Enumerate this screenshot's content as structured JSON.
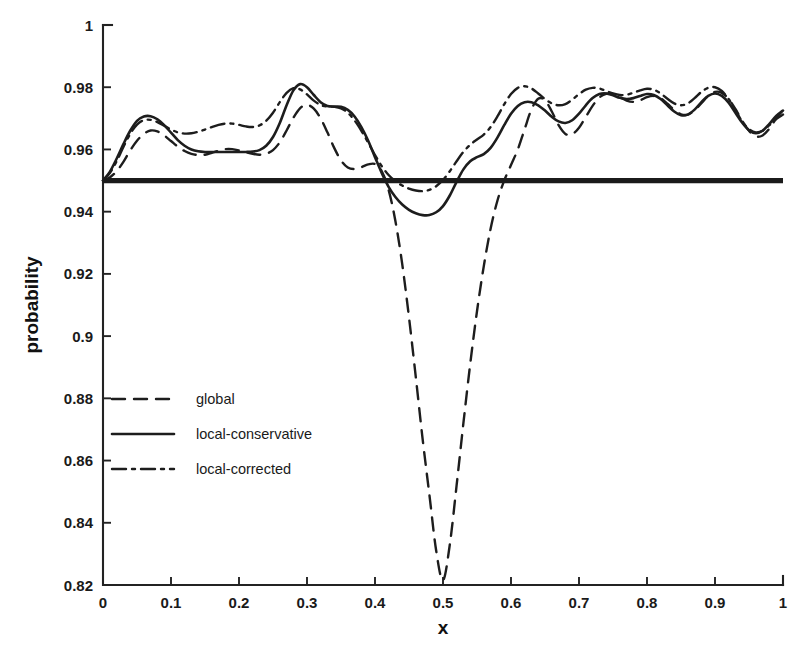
{
  "chart_data": {
    "type": "line",
    "title": "",
    "xlabel": "x",
    "ylabel": "probability",
    "xlim": [
      0,
      1
    ],
    "ylim": [
      0.82,
      1
    ],
    "grid": false,
    "legend_position": "center-left",
    "xticks": [
      0,
      0.1,
      0.2,
      0.3,
      0.4,
      0.5,
      0.6,
      0.7,
      0.8,
      0.9,
      1
    ],
    "xticklabels": [
      "0",
      "0.1",
      "0.2",
      "0.3",
      "0.4",
      "0.5",
      "0.6",
      "0.7",
      "0.8",
      "0.9",
      "1"
    ],
    "yticks": [
      0.82,
      0.84,
      0.86,
      0.88,
      0.9,
      0.92,
      0.94,
      0.96,
      0.98,
      1
    ],
    "yticklabels": [
      "0.82",
      "0.84",
      "0.86",
      "0.88",
      "0.9",
      "0.92",
      "0.94",
      "0.96",
      "0.98",
      "1"
    ],
    "reference_line": {
      "orientation": "horizontal",
      "y": 0.95,
      "label": "",
      "linestyle": "solid",
      "linewidth": 5.2,
      "color": "#1b1b1b"
    },
    "series": [
      {
        "name": "global",
        "linestyle": "dashed",
        "dasharray": "13 9",
        "linewidth": 2.4,
        "color": "#1d1d1d",
        "x": [
          0.0,
          0.01,
          0.02,
          0.03,
          0.04,
          0.05,
          0.06,
          0.07,
          0.08,
          0.09,
          0.1,
          0.11,
          0.12,
          0.13,
          0.14,
          0.15,
          0.16,
          0.17,
          0.18,
          0.19,
          0.2,
          0.21,
          0.22,
          0.23,
          0.24,
          0.25,
          0.26,
          0.27,
          0.28,
          0.29,
          0.3,
          0.31,
          0.32,
          0.33,
          0.34,
          0.35,
          0.36,
          0.37,
          0.38,
          0.39,
          0.4,
          0.41,
          0.42,
          0.43,
          0.44,
          0.45,
          0.46,
          0.47,
          0.48,
          0.49,
          0.5,
          0.51,
          0.52,
          0.53,
          0.54,
          0.55,
          0.56,
          0.57,
          0.58,
          0.59,
          0.6,
          0.61,
          0.62,
          0.63,
          0.64,
          0.65,
          0.66,
          0.67,
          0.68,
          0.69,
          0.7,
          0.71,
          0.72,
          0.73,
          0.74,
          0.75,
          0.76,
          0.77,
          0.78,
          0.79,
          0.8,
          0.81,
          0.82,
          0.83,
          0.84,
          0.85,
          0.86,
          0.87,
          0.88,
          0.89,
          0.9,
          0.91,
          0.92,
          0.93,
          0.94,
          0.95,
          0.96,
          0.97,
          0.98,
          0.99,
          1.0
        ],
        "y": [
          0.95,
          0.951,
          0.953,
          0.956,
          0.9597,
          0.9628,
          0.965,
          0.9661,
          0.9658,
          0.9645,
          0.9627,
          0.9609,
          0.9595,
          0.9586,
          0.9582,
          0.9583,
          0.9589,
          0.9596,
          0.9601,
          0.9601,
          0.9597,
          0.9591,
          0.9586,
          0.9583,
          0.9586,
          0.9598,
          0.9623,
          0.9661,
          0.9702,
          0.9733,
          0.9743,
          0.9731,
          0.97,
          0.9655,
          0.9605,
          0.9565,
          0.9542,
          0.9537,
          0.9543,
          0.9552,
          0.9553,
          0.953,
          0.947,
          0.937,
          0.9232,
          0.906,
          0.8868,
          0.867,
          0.849,
          0.831,
          0.8215,
          0.833,
          0.852,
          0.872,
          0.891,
          0.908,
          0.9225,
          0.9345,
          0.9435,
          0.95,
          0.955,
          0.96,
          0.9665,
          0.9728,
          0.9763,
          0.9758,
          0.9722,
          0.9678,
          0.965,
          0.9649,
          0.967,
          0.9705,
          0.974,
          0.9767,
          0.9779,
          0.9778,
          0.9768,
          0.9757,
          0.9753,
          0.9758,
          0.9768,
          0.9772,
          0.9765,
          0.9747,
          0.9727,
          0.9713,
          0.9712,
          0.9726,
          0.9749,
          0.9772,
          0.9785,
          0.9782,
          0.9762,
          0.973,
          0.9692,
          0.966,
          0.9642,
          0.9645,
          0.9667,
          0.97,
          0.9727
        ]
      },
      {
        "name": "local-conservative",
        "linestyle": "solid",
        "dasharray": "",
        "linewidth": 2.6,
        "color": "#1d1d1d",
        "x": [
          0.0,
          0.01,
          0.02,
          0.03,
          0.04,
          0.05,
          0.06,
          0.07,
          0.08,
          0.09,
          0.1,
          0.11,
          0.12,
          0.13,
          0.14,
          0.15,
          0.16,
          0.17,
          0.18,
          0.19,
          0.2,
          0.21,
          0.22,
          0.23,
          0.24,
          0.25,
          0.26,
          0.27,
          0.28,
          0.29,
          0.3,
          0.31,
          0.32,
          0.33,
          0.34,
          0.35,
          0.36,
          0.37,
          0.38,
          0.39,
          0.4,
          0.41,
          0.42,
          0.43,
          0.44,
          0.45,
          0.46,
          0.47,
          0.48,
          0.49,
          0.5,
          0.51,
          0.52,
          0.53,
          0.54,
          0.55,
          0.56,
          0.57,
          0.58,
          0.59,
          0.6,
          0.61,
          0.62,
          0.63,
          0.64,
          0.65,
          0.66,
          0.67,
          0.68,
          0.69,
          0.7,
          0.71,
          0.72,
          0.73,
          0.74,
          0.75,
          0.76,
          0.77,
          0.78,
          0.79,
          0.8,
          0.81,
          0.82,
          0.83,
          0.84,
          0.85,
          0.86,
          0.87,
          0.88,
          0.89,
          0.9,
          0.91,
          0.92,
          0.93,
          0.94,
          0.95,
          0.96,
          0.97,
          0.98,
          0.99,
          1.0
        ],
        "y": [
          0.95,
          0.9528,
          0.957,
          0.9617,
          0.966,
          0.9692,
          0.9706,
          0.9707,
          0.9697,
          0.9678,
          0.9654,
          0.963,
          0.9612,
          0.96,
          0.9594,
          0.9592,
          0.9592,
          0.9592,
          0.9592,
          0.9592,
          0.9592,
          0.9592,
          0.9593,
          0.9598,
          0.9612,
          0.964,
          0.9685,
          0.9742,
          0.979,
          0.981,
          0.98,
          0.9775,
          0.9752,
          0.974,
          0.9738,
          0.9737,
          0.9727,
          0.9706,
          0.9672,
          0.9628,
          0.9575,
          0.9524,
          0.948,
          0.9447,
          0.9423,
          0.9406,
          0.9395,
          0.9389,
          0.9389,
          0.9398,
          0.9418,
          0.9452,
          0.9496,
          0.9536,
          0.9562,
          0.9575,
          0.9585,
          0.9605,
          0.9638,
          0.9678,
          0.9715,
          0.974,
          0.9752,
          0.9752,
          0.9742,
          0.9725,
          0.9705,
          0.969,
          0.9685,
          0.9694,
          0.9715,
          0.9742,
          0.9765,
          0.9778,
          0.978,
          0.9774,
          0.9766,
          0.9762,
          0.9765,
          0.9772,
          0.9778,
          0.9775,
          0.9762,
          0.9742,
          0.9722,
          0.971,
          0.9712,
          0.9728,
          0.9752,
          0.9772,
          0.978,
          0.9772,
          0.975,
          0.9718,
          0.9686,
          0.9662,
          0.9652,
          0.966,
          0.9682,
          0.9708,
          0.9725
        ]
      },
      {
        "name": "local-corrected",
        "linestyle": "dashdot",
        "dasharray": "14 6 3 6",
        "linewidth": 2.4,
        "color": "#1d1d1d",
        "x": [
          0.0,
          0.01,
          0.02,
          0.03,
          0.04,
          0.05,
          0.06,
          0.07,
          0.08,
          0.09,
          0.1,
          0.11,
          0.12,
          0.13,
          0.14,
          0.15,
          0.16,
          0.17,
          0.18,
          0.19,
          0.2,
          0.21,
          0.22,
          0.23,
          0.24,
          0.25,
          0.26,
          0.27,
          0.28,
          0.29,
          0.3,
          0.31,
          0.32,
          0.33,
          0.34,
          0.35,
          0.36,
          0.37,
          0.38,
          0.39,
          0.4,
          0.41,
          0.42,
          0.43,
          0.44,
          0.45,
          0.46,
          0.47,
          0.48,
          0.49,
          0.5,
          0.51,
          0.52,
          0.53,
          0.54,
          0.55,
          0.56,
          0.57,
          0.58,
          0.59,
          0.6,
          0.61,
          0.62,
          0.63,
          0.64,
          0.65,
          0.66,
          0.67,
          0.68,
          0.69,
          0.7,
          0.71,
          0.72,
          0.73,
          0.74,
          0.75,
          0.76,
          0.77,
          0.78,
          0.79,
          0.8,
          0.81,
          0.82,
          0.83,
          0.84,
          0.85,
          0.86,
          0.87,
          0.88,
          0.89,
          0.9,
          0.91,
          0.92,
          0.93,
          0.94,
          0.95,
          0.96,
          0.97,
          0.98,
          0.99,
          1.0
        ],
        "y": [
          0.95,
          0.9524,
          0.9562,
          0.9608,
          0.965,
          0.968,
          0.9694,
          0.9695,
          0.9688,
          0.9676,
          0.9664,
          0.9655,
          0.9651,
          0.9652,
          0.9657,
          0.9664,
          0.9672,
          0.9679,
          0.9683,
          0.9683,
          0.9679,
          0.9674,
          0.9672,
          0.9677,
          0.9692,
          0.9718,
          0.9752,
          0.9782,
          0.9797,
          0.9793,
          0.9777,
          0.9757,
          0.9743,
          0.9738,
          0.9737,
          0.9732,
          0.9718,
          0.9693,
          0.966,
          0.9622,
          0.9582,
          0.9546,
          0.9518,
          0.9498,
          0.9484,
          0.9474,
          0.9468,
          0.9466,
          0.947,
          0.9482,
          0.9502,
          0.953,
          0.9562,
          0.9592,
          0.9615,
          0.9632,
          0.9648,
          0.9672,
          0.9706,
          0.9745,
          0.9778,
          0.9798,
          0.9803,
          0.9796,
          0.978,
          0.9762,
          0.9748,
          0.9742,
          0.9746,
          0.976,
          0.9778,
          0.9792,
          0.9798,
          0.9796,
          0.9788,
          0.978,
          0.9775,
          0.9776,
          0.9782,
          0.979,
          0.9795,
          0.9792,
          0.978,
          0.9763,
          0.9748,
          0.9742,
          0.9748,
          0.9765,
          0.9785,
          0.9798,
          0.98,
          0.9788,
          0.9762,
          0.9726,
          0.969,
          0.9665,
          0.9655,
          0.966,
          0.9678,
          0.9698,
          0.9712
        ]
      }
    ],
    "legend_entries": [
      {
        "label": "global",
        "linestyle": "dashed",
        "dasharray": "13 9"
      },
      {
        "label": "local-conservative",
        "linestyle": "solid",
        "dasharray": ""
      },
      {
        "label": "local-corrected",
        "linestyle": "dashdot",
        "dasharray": "14 6 3 6"
      }
    ]
  }
}
